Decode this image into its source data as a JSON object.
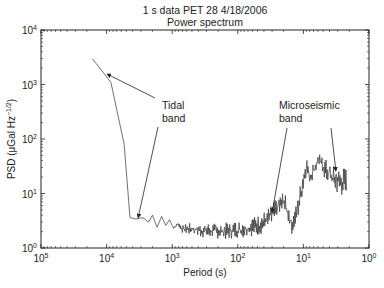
{
  "chart_data": {
    "type": "line",
    "title": "1 s data PET 28 4/18/2006",
    "subtitle": "Power spectrum",
    "xlabel": "Period (s)",
    "ylabel": "PSD (μGal Hz",
    "ylabel_exp": "−1/2",
    "ylabel_close": ")",
    "x_scale": "log",
    "y_scale": "log",
    "x_reversed": true,
    "xlim": [
      100000,
      1
    ],
    "ylim": [
      1,
      10000
    ],
    "grid": false,
    "x_ticks": [
      {
        "value": 100000,
        "base": "10",
        "exp": "5"
      },
      {
        "value": 10000,
        "base": "10",
        "exp": "4"
      },
      {
        "value": 1000,
        "base": "10",
        "exp": "3"
      },
      {
        "value": 100,
        "base": "10",
        "exp": "2"
      },
      {
        "value": 10,
        "base": "10",
        "exp": "1"
      },
      {
        "value": 1,
        "base": "10",
        "exp": "0"
      }
    ],
    "y_ticks": [
      {
        "value": 1,
        "base": "10",
        "exp": "0"
      },
      {
        "value": 10,
        "base": "10",
        "exp": "1"
      },
      {
        "value": 100,
        "base": "10",
        "exp": "2"
      },
      {
        "value": 1000,
        "base": "10",
        "exp": "3"
      },
      {
        "value": 10000,
        "base": "10",
        "exp": "4"
      }
    ],
    "series": [
      {
        "name": "PSD",
        "color": "#333333",
        "points": [
          [
            16600,
            3000,
            3000
          ],
          [
            8600,
            1100,
            1100
          ],
          [
            5400,
            80,
            80
          ],
          [
            4400,
            3.6,
            3.6
          ],
          [
            3600,
            3.4,
            3.4
          ],
          [
            2800,
            3.6,
            3.6
          ],
          [
            2300,
            3.0,
            3.0
          ],
          [
            2000,
            4.0,
            4.0
          ],
          [
            1700,
            2.4,
            2.4
          ],
          [
            1450,
            3.8,
            3.8
          ],
          [
            1250,
            2.6,
            2.6
          ],
          [
            1100,
            3.3,
            3.3
          ],
          [
            950,
            2.2,
            2.4
          ],
          [
            820,
            2.6,
            3.0
          ],
          [
            700,
            1.9,
            2.6
          ],
          [
            600,
            1.8,
            2.8
          ],
          [
            500,
            1.7,
            2.9
          ],
          [
            400,
            1.6,
            2.8
          ],
          [
            300,
            1.5,
            2.9
          ],
          [
            220,
            1.5,
            2.8
          ],
          [
            160,
            1.4,
            2.9
          ],
          [
            120,
            1.5,
            3.0
          ],
          [
            90,
            1.5,
            3.2
          ],
          [
            70,
            1.6,
            3.6
          ],
          [
            50,
            1.7,
            3.9
          ],
          [
            38,
            1.9,
            4.8
          ],
          [
            30,
            2.5,
            6.5
          ],
          [
            24,
            3.5,
            9.0
          ],
          [
            20,
            4.6,
            11.0
          ],
          [
            17,
            2.8,
            7.0
          ],
          [
            15,
            1.8,
            3.6
          ],
          [
            12.5,
            2.8,
            7.0
          ],
          [
            10.5,
            8.0,
            22.0
          ],
          [
            9,
            22.0,
            50.0
          ],
          [
            8,
            14.0,
            30.0
          ],
          [
            7,
            18.0,
            40.0
          ],
          [
            6,
            28.0,
            58.0
          ],
          [
            5,
            20.0,
            48.0
          ],
          [
            4,
            13.0,
            36.0
          ],
          [
            3.2,
            10.0,
            30.0
          ],
          [
            2.6,
            9.0,
            30.0
          ],
          [
            2.2,
            8.0,
            30.0
          ]
        ]
      }
    ],
    "annotations": [
      {
        "text_lines": [
          "Tidal",
          "band"
        ],
        "arrows_to": [
          [
            9800,
            1550
          ],
          [
            3300,
            3.6
          ]
        ]
      },
      {
        "text_lines": [
          "Microseismic",
          "band"
        ],
        "arrows_to": [
          [
            30,
            4.5
          ],
          [
            3.2,
            26
          ]
        ]
      }
    ]
  }
}
